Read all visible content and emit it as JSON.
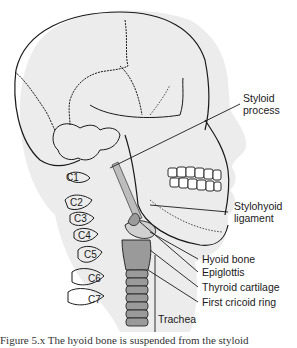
{
  "figure": {
    "colors": {
      "background": "#ffffff",
      "head_fill": "#ececec",
      "outline": "#1a1a1a",
      "airway_fill": "#9a9a9a",
      "airway_light": "#bdbdbd"
    },
    "labels": {
      "styloid_process_line1": "Styloid",
      "styloid_process_line2": "process",
      "stylohyoid_ligament_line1": "Stylohyoid",
      "stylohyoid_ligament_line2": "ligament",
      "hyoid_bone": "Hyoid bone",
      "epiglottis": "Epiglottis",
      "thyroid_cartilage": "Thyroid cartilage",
      "first_cricoid_ring": "First cricoid ring",
      "trachea": "Trachea"
    },
    "vertebrae": [
      "C1",
      "C2",
      "C3",
      "C4",
      "C5",
      "C6",
      "C7"
    ],
    "caption_partial": "Figure 5.x   The hyoid bone is suspended from the styloid"
  }
}
